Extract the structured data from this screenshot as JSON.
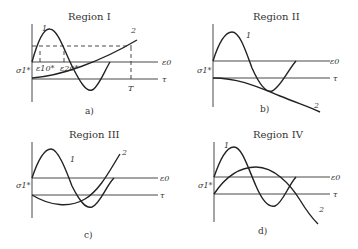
{
  "panels": [
    {
      "title": "Region I",
      "caption": "a)",
      "curve1": "1",
      "curve2": "2",
      "axis_top": "ε0",
      "axis_bottom": "τ",
      "y_label": "σ1*",
      "marks": [
        "ε10*",
        "ε20*"
      ],
      "t_mark": "T"
    },
    {
      "title": "Region II",
      "caption": "b)",
      "curve1": "1",
      "curve2": "2",
      "axis_top": "ε0",
      "axis_bottom": "τ",
      "y_label": "σ1*"
    },
    {
      "title": "Region III",
      "caption": "c)",
      "curve1": "1",
      "curve2": "2",
      "axis_top": "ε0",
      "axis_bottom": "τ",
      "y_label": "σ1*"
    },
    {
      "title": "Region IV",
      "caption": "d)",
      "curve1": "1",
      "curve2": "2",
      "axis_top": "ε0",
      "axis_bottom": "τ",
      "y_label": "σ1*"
    }
  ]
}
